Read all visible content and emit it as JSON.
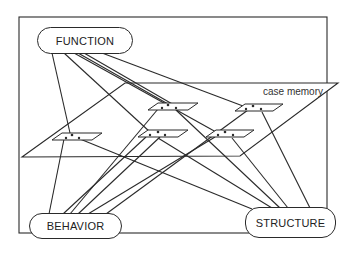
{
  "diagram": {
    "nodes": {
      "function": "FUNCTION",
      "behavior": "BEHAVIOR",
      "structure": "STRUCTURE"
    },
    "plane_label": "case memory",
    "cases": [
      {
        "id": "case-a"
      },
      {
        "id": "case-b"
      },
      {
        "id": "case-c"
      },
      {
        "id": "case-d"
      },
      {
        "id": "case-e"
      }
    ],
    "colors": {
      "line": "#2a2a2a",
      "background": "#ffffff"
    }
  }
}
